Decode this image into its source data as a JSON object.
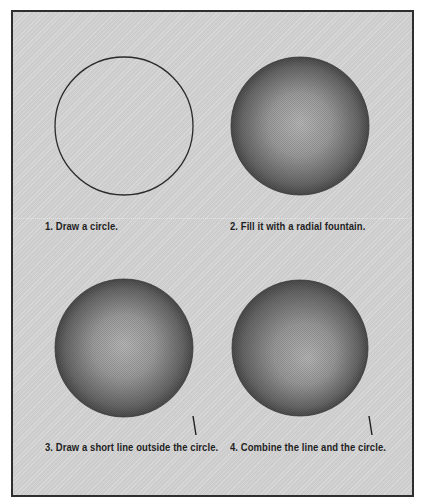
{
  "figure": {
    "background_color": "#d3d3d3",
    "border_color": "#2e2e2e",
    "steps": [
      {
        "number": 1,
        "caption": "1. Draw a circle.",
        "circle": {
          "cx": 124,
          "cy": 126,
          "r": 69,
          "fill": "none",
          "stroke": "#2a2a2a"
        },
        "line": null
      },
      {
        "number": 2,
        "caption": "2. Fill it with a radial fountain.",
        "circle": {
          "cx": 300,
          "cy": 126,
          "r": 69,
          "fill": "radial-fountain",
          "center_color": "#b4b4b4",
          "edge_color": "#4a4a4a"
        },
        "line": null
      },
      {
        "number": 3,
        "caption": "3. Draw a short line outside the circle.",
        "circle": {
          "cx": 124,
          "cy": 348,
          "r": 69,
          "fill": "radial-fountain",
          "center_color": "#b4b4b4",
          "edge_color": "#4a4a4a"
        },
        "line": {
          "x1": 193,
          "y1": 416,
          "x2": 196,
          "y2": 435
        }
      },
      {
        "number": 4,
        "caption": "4. Combine the line and the circle.",
        "circle": {
          "cx": 300,
          "cy": 348,
          "r": 68,
          "fill": "radial-fountain",
          "center_color": "#b4b4b4",
          "edge_color": "#4a4a4a"
        },
        "line": {
          "x1": 369,
          "y1": 416,
          "x2": 372,
          "y2": 435
        }
      }
    ]
  }
}
